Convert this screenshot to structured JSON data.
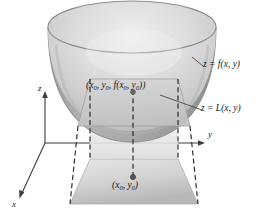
{
  "figure": {
    "background_color": "#ffffff",
    "width": 264,
    "height": 217
  },
  "axes": {
    "x_label": "x",
    "y_label": "y",
    "z_label": "z",
    "color": "#3c3c3c",
    "origin": {
      "x": 45,
      "y": 143
    }
  },
  "labels": {
    "surface": "z = f(x, y)",
    "tangent_plane": "z = L(x, y)",
    "point_on_surface_prefix": "(x",
    "point_on_surface": "(x0, y0, f(x0, y0))",
    "point_in_plane": "(x0, y0)",
    "subscript": "0"
  },
  "colors": {
    "bowl_outer": "#9a9a9a",
    "bowl_inner_light": "#e3e3e3",
    "bowl_inner_mid": "#c4c4c4",
    "bowl_rim": "#8d8d8d",
    "tangent_plane": "#cfcfcf",
    "base_plane_light": "#e8e8e8",
    "base_plane_dark": "#b6b6b6",
    "dashed_line": "#2a2a2a",
    "leader_line": "#4a4a4a",
    "dot": "#5a5a5a",
    "outline": "#7d7d7d"
  },
  "elements": {
    "surface_name": "paraboloid-bowl",
    "tangent_plane_name": "tangent-plane",
    "base_plane_name": "base-plane-rectangle",
    "point_marker_upper": "point-on-surface-dot",
    "point_marker_lower": "point-in-xy-plane-dot",
    "dashed_guides": "projection-dashed-lines"
  }
}
